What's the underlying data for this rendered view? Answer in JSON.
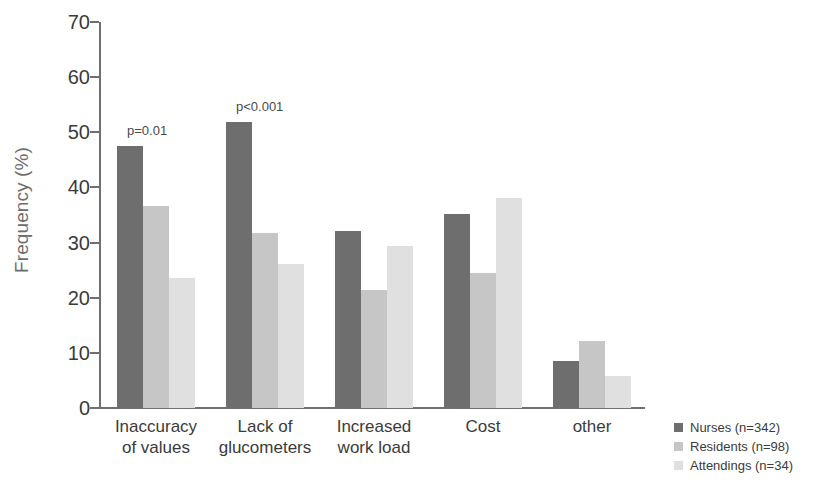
{
  "chart_data": {
    "type": "bar",
    "title": "",
    "xlabel": "",
    "ylabel": "Frequency (%)",
    "ylim": [
      0,
      70
    ],
    "yticks": [
      0,
      10,
      20,
      30,
      40,
      50,
      60,
      70
    ],
    "grid": false,
    "legend_position": "bottom-right",
    "categories": [
      "Inaccuracy\nof values",
      "Lack of\nglucometers",
      "Increased\nwork load",
      "Cost",
      "other"
    ],
    "series": [
      {
        "name": "Nurses (n=342)",
        "color": "#6e6e6e",
        "values": [
          47.5,
          51.8,
          32.1,
          35.1,
          8.5
        ]
      },
      {
        "name": "Residents (n=98)",
        "color": "#c6c6c6",
        "values": [
          36.7,
          31.8,
          21.4,
          24.4,
          12.2
        ]
      },
      {
        "name": "Attendings (n=34)",
        "color": "#e0e0e0",
        "values": [
          23.5,
          26.2,
          29.4,
          38.1,
          5.8
        ]
      }
    ],
    "annotations": [
      {
        "text": "p=0.01",
        "category": "Inaccuracy of values"
      },
      {
        "text": "p<0.001",
        "category": "Lack of glucometers"
      }
    ]
  },
  "legend": {
    "items": [
      {
        "label": "Nurses (n=342)"
      },
      {
        "label": "Residents (n=98)"
      },
      {
        "label": "Attendings (n=34)"
      }
    ]
  }
}
